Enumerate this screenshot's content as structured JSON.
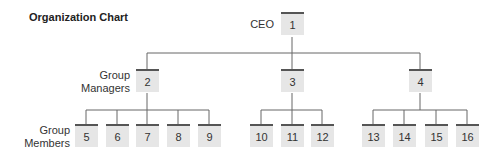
{
  "title": "Organization Chart",
  "labels": {
    "ceo": "CEO",
    "managers": [
      "Group",
      "Managers"
    ],
    "members": [
      "Group",
      "Members"
    ]
  },
  "nodes": {
    "ceo": "1",
    "managers": [
      "2",
      "3",
      "4"
    ],
    "members_of_2": [
      "5",
      "6",
      "7",
      "8",
      "9"
    ],
    "members_of_3": [
      "10",
      "11",
      "12"
    ],
    "members_of_4": [
      "13",
      "14",
      "15",
      "16"
    ]
  }
}
